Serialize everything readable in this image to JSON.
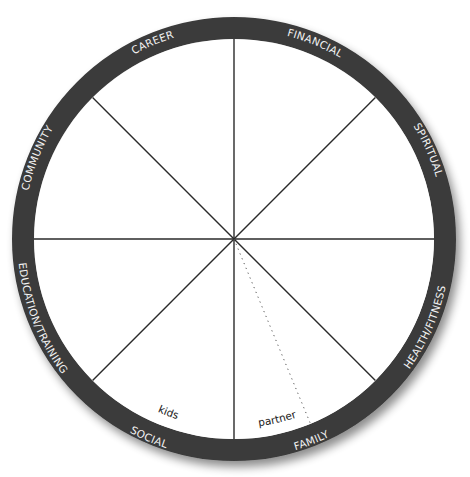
{
  "diagram": {
    "type": "wheel-of-life",
    "center": [
      234,
      239
    ],
    "outer_radius": 222,
    "inner_radius": 200,
    "colors": {
      "ring": "#3b3b3b",
      "spokes": "#2a2a2a",
      "ring_text": "#f2f2f2",
      "sub_text": "#1a1a1a",
      "background": "#ffffff"
    },
    "segments": [
      {
        "label": "CAREER"
      },
      {
        "label": "FINANCIAL"
      },
      {
        "label": "SPIRITUAL"
      },
      {
        "label": "HEALTH/FITNESS"
      },
      {
        "label": "FAMILY"
      },
      {
        "label": "SOCIAL"
      },
      {
        "label": "EDUCATION/TRAINING"
      },
      {
        "label": "COMMUNITY"
      }
    ],
    "family_subdivisions": [
      {
        "label": "kids"
      },
      {
        "label": "partner"
      }
    ]
  }
}
